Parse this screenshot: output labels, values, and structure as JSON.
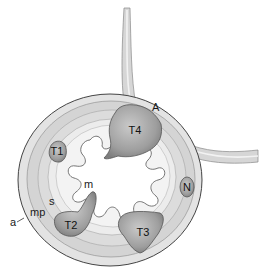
{
  "diagram": {
    "type": "anatomical-cross-section",
    "colors": {
      "background": "#ffffff",
      "wall_outer": "#d9d9d9",
      "wall_inner": "#ebebeb",
      "tumor": "#a8a8a8",
      "outline": "#555555"
    },
    "labels": {
      "adjacent_structure": "A",
      "node": "N",
      "adventitia": "a",
      "muscularis_propria": "mp",
      "submucosa": "s",
      "mucosa": "m"
    },
    "tumors": [
      {
        "id": "T1",
        "label": "T1"
      },
      {
        "id": "T2",
        "label": "T2"
      },
      {
        "id": "T3",
        "label": "T3"
      },
      {
        "id": "T4",
        "label": "T4"
      }
    ]
  }
}
